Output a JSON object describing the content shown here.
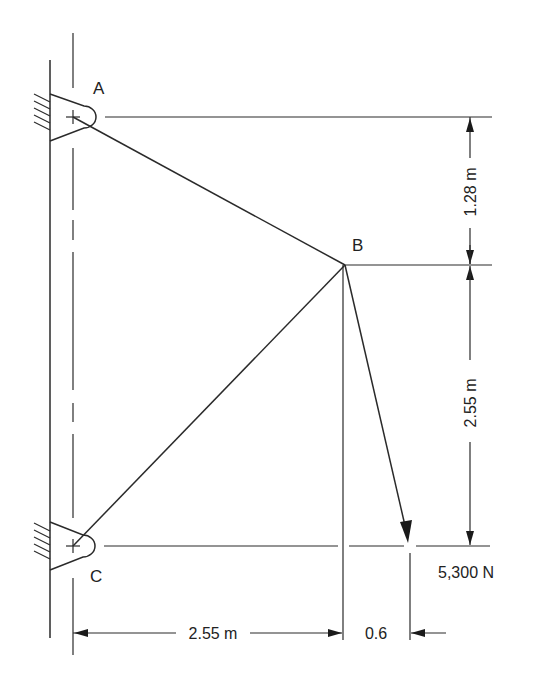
{
  "figure": {
    "type": "engineering-statics-diagram"
  },
  "points": {
    "A": {
      "label": "A",
      "support": "pin-to-wall"
    },
    "B": {
      "label": "B",
      "support": "joint"
    },
    "C": {
      "label": "C",
      "support": "pin-to-wall"
    }
  },
  "members": [
    {
      "name": "AB",
      "from": "A",
      "to": "B"
    },
    {
      "name": "BC",
      "from": "C",
      "to": "B"
    }
  ],
  "load": {
    "value": "5,300 N",
    "applied_at": "B",
    "direction": "down-right, run 0.6 over drop 2.55"
  },
  "dimensions": {
    "vertical_AB": "1.28 m",
    "vertical_BC": "2.55 m",
    "horizontal_CB": "2.55 m",
    "horizontal_load_offset": "0.6"
  },
  "colors": {
    "ink": "#2a2a2a",
    "background": "#ffffff"
  }
}
